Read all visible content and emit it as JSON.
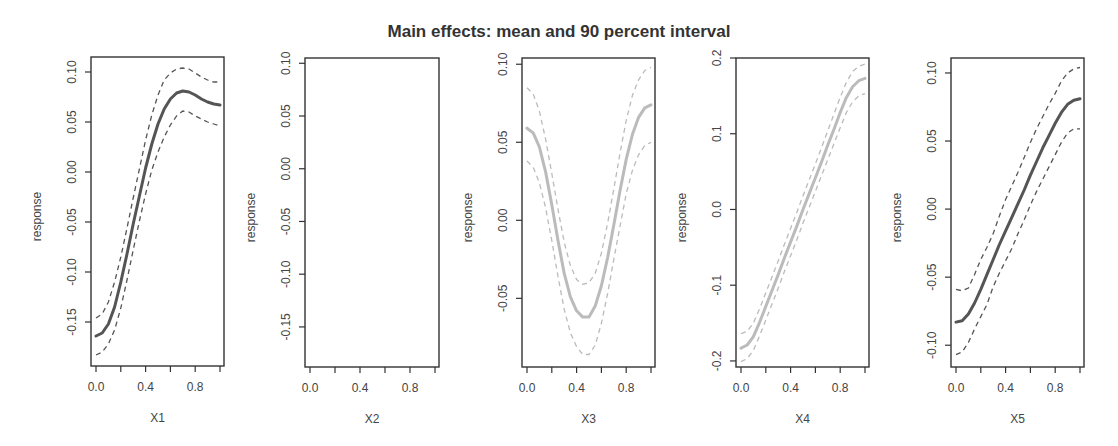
{
  "title": "Main effects: mean and 90 percent interval",
  "chart_data": {
    "type": "line",
    "title": "Main effects: mean and 90 percent interval",
    "panels": [
      {
        "xlabel": "X1",
        "ylabel": "response",
        "xticks": [
          "0.0",
          "0.4",
          "0.8"
        ],
        "xlim": [
          0,
          1
        ],
        "yticks": [
          "-0.15",
          "-0.10",
          "-0.05",
          "0.00",
          "0.05",
          "0.10"
        ],
        "ytick_values": [
          -0.15,
          -0.1,
          -0.05,
          0.0,
          0.05,
          0.1
        ],
        "ylim": [
          -0.194,
          0.115
        ],
        "line_color": "#555555",
        "x": [
          0.0,
          0.05,
          0.1,
          0.15,
          0.2,
          0.25,
          0.3,
          0.35,
          0.4,
          0.45,
          0.5,
          0.55,
          0.6,
          0.65,
          0.7,
          0.75,
          0.8,
          0.85,
          0.9,
          0.95,
          1.0
        ],
        "mean": [
          -0.164,
          -0.161,
          -0.152,
          -0.135,
          -0.11,
          -0.082,
          -0.052,
          -0.024,
          0.004,
          0.028,
          0.048,
          0.063,
          0.073,
          0.079,
          0.081,
          0.08,
          0.077,
          0.073,
          0.07,
          0.068,
          0.067
        ],
        "upper": [
          -0.146,
          -0.142,
          -0.13,
          -0.11,
          -0.085,
          -0.056,
          -0.026,
          0.003,
          0.032,
          0.057,
          0.077,
          0.092,
          0.099,
          0.103,
          0.104,
          0.103,
          0.099,
          0.095,
          0.092,
          0.09,
          0.09
        ],
        "lower": [
          -0.183,
          -0.18,
          -0.172,
          -0.158,
          -0.136,
          -0.108,
          -0.078,
          -0.049,
          -0.022,
          0.002,
          0.02,
          0.035,
          0.047,
          0.056,
          0.061,
          0.06,
          0.056,
          0.053,
          0.05,
          0.048,
          0.046
        ]
      },
      {
        "xlabel": "X2",
        "ylabel": "response",
        "xticks": [
          "0.0",
          "0.4",
          "0.8"
        ],
        "xlim": [
          0,
          1
        ],
        "yticks": [
          "-0.15",
          "-0.10",
          "-0.05",
          "0.00",
          "0.05",
          "0.10"
        ],
        "ytick_values": [
          -0.15,
          -0.1,
          -0.05,
          0.0,
          0.05,
          0.1
        ],
        "ylim": [
          -0.188,
          0.105
        ],
        "line_color": "#555555",
        "x": [],
        "mean": [],
        "upper": [],
        "lower": []
      },
      {
        "xlabel": "X3",
        "ylabel": "response",
        "xticks": [
          "0.0",
          "0.4",
          "0.8"
        ],
        "xlim": [
          0,
          1
        ],
        "yticks": [
          "-0.05",
          "0.00",
          "0.05",
          "0.10"
        ],
        "ytick_values": [
          -0.05,
          0.0,
          0.05,
          0.1
        ],
        "ylim": [
          -0.094,
          0.104
        ],
        "line_color": "#bbbbbb",
        "x": [
          0.0,
          0.05,
          0.1,
          0.15,
          0.2,
          0.25,
          0.3,
          0.35,
          0.4,
          0.45,
          0.5,
          0.55,
          0.6,
          0.65,
          0.7,
          0.75,
          0.8,
          0.85,
          0.9,
          0.95,
          1.0
        ],
        "mean": [
          0.059,
          0.056,
          0.047,
          0.031,
          0.01,
          -0.013,
          -0.034,
          -0.049,
          -0.058,
          -0.062,
          -0.062,
          -0.055,
          -0.042,
          -0.024,
          -0.003,
          0.019,
          0.039,
          0.055,
          0.066,
          0.072,
          0.074
        ],
        "upper": [
          0.085,
          0.081,
          0.07,
          0.052,
          0.03,
          0.007,
          -0.014,
          -0.029,
          -0.038,
          -0.041,
          -0.04,
          -0.034,
          -0.021,
          -0.002,
          0.02,
          0.043,
          0.064,
          0.08,
          0.09,
          0.096,
          0.098
        ],
        "lower": [
          0.038,
          0.034,
          0.024,
          0.008,
          -0.013,
          -0.036,
          -0.057,
          -0.072,
          -0.081,
          -0.086,
          -0.086,
          -0.08,
          -0.066,
          -0.047,
          -0.025,
          -0.004,
          0.017,
          0.032,
          0.042,
          0.048,
          0.05
        ]
      },
      {
        "xlabel": "X4",
        "ylabel": "response",
        "xticks": [
          "0.0",
          "0.4",
          "0.8"
        ],
        "xlim": [
          0,
          1
        ],
        "yticks": [
          "-0.2",
          "-0.1",
          "0.0",
          "0.1",
          "0.2"
        ],
        "ytick_values": [
          -0.2,
          -0.1,
          0.0,
          0.1,
          0.2
        ],
        "ylim": [
          -0.208,
          0.2
        ],
        "line_color": "#bbbbbb",
        "x": [
          0.0,
          0.05,
          0.1,
          0.15,
          0.2,
          0.25,
          0.3,
          0.35,
          0.4,
          0.45,
          0.5,
          0.55,
          0.6,
          0.65,
          0.7,
          0.75,
          0.8,
          0.85,
          0.9,
          0.95,
          1.0
        ],
        "mean": [
          -0.183,
          -0.179,
          -0.168,
          -0.149,
          -0.128,
          -0.107,
          -0.086,
          -0.064,
          -0.043,
          -0.022,
          0.0,
          0.021,
          0.042,
          0.063,
          0.085,
          0.106,
          0.128,
          0.148,
          0.162,
          0.17,
          0.173
        ],
        "upper": [
          -0.164,
          -0.161,
          -0.15,
          -0.131,
          -0.11,
          -0.089,
          -0.068,
          -0.046,
          -0.025,
          -0.004,
          0.018,
          0.039,
          0.06,
          0.082,
          0.104,
          0.126,
          0.148,
          0.168,
          0.182,
          0.189,
          0.192
        ],
        "lower": [
          -0.201,
          -0.197,
          -0.186,
          -0.167,
          -0.146,
          -0.125,
          -0.104,
          -0.082,
          -0.061,
          -0.04,
          -0.018,
          0.003,
          0.024,
          0.045,
          0.066,
          0.087,
          0.108,
          0.128,
          0.142,
          0.15,
          0.153
        ]
      },
      {
        "xlabel": "X5",
        "ylabel": "response",
        "xticks": [
          "0.0",
          "0.4",
          "0.8"
        ],
        "xlim": [
          0,
          1
        ],
        "yticks": [
          "-0.10",
          "-0.05",
          "0.00",
          "0.05",
          "0.10"
        ],
        "ytick_values": [
          -0.1,
          -0.05,
          0.0,
          0.05,
          0.1
        ],
        "ylim": [
          -0.116,
          0.111
        ],
        "line_color": "#555555",
        "x": [
          0.0,
          0.05,
          0.1,
          0.15,
          0.2,
          0.25,
          0.3,
          0.35,
          0.4,
          0.45,
          0.5,
          0.55,
          0.6,
          0.65,
          0.7,
          0.75,
          0.8,
          0.85,
          0.9,
          0.95,
          1.0
        ],
        "mean": [
          -0.083,
          -0.082,
          -0.077,
          -0.069,
          -0.059,
          -0.048,
          -0.037,
          -0.026,
          -0.016,
          -0.006,
          0.004,
          0.014,
          0.025,
          0.035,
          0.045,
          0.054,
          0.063,
          0.071,
          0.077,
          0.08,
          0.081
        ],
        "upper": [
          -0.059,
          -0.06,
          -0.058,
          -0.048,
          -0.037,
          -0.028,
          -0.018,
          -0.005,
          0.007,
          0.017,
          0.027,
          0.038,
          0.049,
          0.059,
          0.068,
          0.077,
          0.085,
          0.094,
          0.1,
          0.103,
          0.104
        ],
        "lower": [
          -0.107,
          -0.105,
          -0.098,
          -0.088,
          -0.079,
          -0.07,
          -0.057,
          -0.047,
          -0.038,
          -0.029,
          -0.018,
          -0.008,
          0.003,
          0.013,
          0.022,
          0.031,
          0.04,
          0.049,
          0.056,
          0.059,
          0.059
        ]
      }
    ]
  },
  "layout": {
    "boxes": [
      {
        "left": 91,
        "top": 57,
        "right": 224,
        "bottom": 366
      },
      {
        "left": 305,
        "top": 58,
        "right": 439,
        "bottom": 367
      },
      {
        "left": 522,
        "top": 58,
        "right": 655,
        "bottom": 367
      },
      {
        "left": 736,
        "top": 58,
        "right": 869,
        "bottom": 367
      },
      {
        "left": 951,
        "top": 58,
        "right": 1084,
        "bottom": 367
      }
    ]
  }
}
